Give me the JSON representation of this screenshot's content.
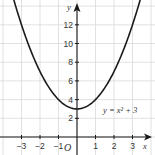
{
  "chart_data": {
    "type": "line",
    "title": "",
    "xlabel": "x",
    "ylabel": "y",
    "origin_label": "O",
    "function": "y = x^2 + 3",
    "annotation": "y = x² + 3",
    "xlim": [
      -4,
      4
    ],
    "ylim": [
      -1.9,
      14.6
    ],
    "x_ticks": [
      -3,
      -2,
      -1,
      1,
      2,
      3
    ],
    "x_tick_labels": [
      "−3",
      "−2",
      "−1",
      "1",
      "2",
      "3"
    ],
    "y_ticks": [
      2,
      4,
      6,
      8,
      10,
      12
    ],
    "y_tick_labels": [
      "2",
      "4",
      "6",
      "8",
      "10",
      "12"
    ],
    "grid": true,
    "series": [
      {
        "name": "y = x² + 3",
        "x": [
          -3.4,
          -3,
          -2.5,
          -2,
          -1.5,
          -1,
          -0.5,
          0,
          0.5,
          1,
          1.5,
          2,
          2.5,
          3,
          3.4
        ],
        "values": [
          14.56,
          12,
          9.25,
          7,
          5.25,
          4,
          3.25,
          3,
          3.25,
          4,
          5.25,
          7,
          9.25,
          12,
          14.56
        ]
      }
    ],
    "colors": {
      "curve": "#1a1a1a",
      "grid": "#d9d9d9",
      "axis": "#1a1a1a",
      "text": "#333333"
    }
  }
}
